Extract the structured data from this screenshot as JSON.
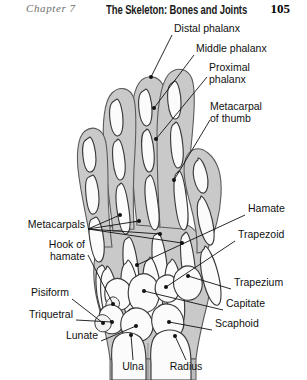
{
  "running_head": {
    "chapter": "Chapter 7",
    "title": "The Skeleton: Bones and Joints",
    "page_number": "105"
  },
  "figure": {
    "colors": {
      "bone_fill": "#fbfbfb",
      "bone_outline": "#3a3a3a",
      "soft_tissue_fill": "#c9c9c9",
      "soft_tissue_outline": "#555555",
      "leader_line": "#111111",
      "label_text": "#111111",
      "page_background": "#ffffff"
    },
    "labels": [
      {
        "id": "distal-phalanx",
        "text": "Distal phalanx",
        "align": "left",
        "x": 174,
        "y": 10
      },
      {
        "id": "middle-phalanx",
        "text": "Middle phalanx",
        "align": "left",
        "x": 196,
        "y": 30
      },
      {
        "id": "proximal-phalanx",
        "text": "Proximal\nphalanx",
        "align": "left",
        "x": 209,
        "y": 49
      },
      {
        "id": "metacarpal-thumb",
        "text": "Metacarpal\nof thumb",
        "align": "left",
        "x": 212,
        "y": 88
      },
      {
        "id": "metacarpals",
        "text": "Metacarpals",
        "align": "right",
        "x": 85,
        "y": 206
      },
      {
        "id": "hamate",
        "text": "Hamate",
        "align": "left",
        "x": 248,
        "y": 190
      },
      {
        "id": "trapezoid",
        "text": "Trapezoid",
        "align": "left",
        "x": 238,
        "y": 216
      },
      {
        "id": "hook-of-hamate",
        "text": "Hook of\nhamate",
        "align": "right",
        "x": 85,
        "y": 229
      },
      {
        "id": "trapezium",
        "text": "Trapezium",
        "align": "left",
        "x": 234,
        "y": 264
      },
      {
        "id": "pisiform",
        "text": "Pisiform",
        "align": "right",
        "x": 69,
        "y": 274
      },
      {
        "id": "capitate",
        "text": "Capitate",
        "align": "left",
        "x": 226,
        "y": 285
      },
      {
        "id": "triquetral",
        "text": "Triquetral",
        "align": "right",
        "x": 73,
        "y": 296
      },
      {
        "id": "scaphoid",
        "text": "Scaphoid",
        "align": "left",
        "x": 215,
        "y": 305
      },
      {
        "id": "lunate",
        "text": "Lunate",
        "align": "right",
        "x": 98,
        "y": 317
      },
      {
        "id": "ulna",
        "text": "Ulna",
        "align": "center",
        "x": 133,
        "y": 343
      },
      {
        "id": "radius",
        "text": "Radius",
        "align": "center",
        "x": 186,
        "y": 343
      }
    ]
  }
}
